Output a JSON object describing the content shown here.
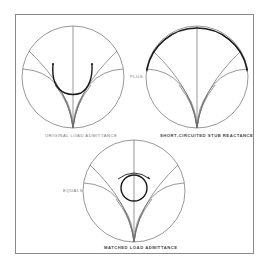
{
  "figure": {
    "panels": [
      {
        "id": "original",
        "caption": "ORIGINAL LOAD ADMITTANCE",
        "point_labels": [
          "Y",
          "Y",
          "Y"
        ]
      },
      {
        "id": "stub",
        "caption": "SHORT-CIRCUITED STUB REACTANCE",
        "point_labels": [
          "Y"
        ]
      },
      {
        "id": "matched",
        "caption": "MATCHED LOAD ADMITTANCE",
        "point_labels": [
          "Y",
          "Y",
          "Y"
        ]
      }
    ],
    "operators": {
      "plus": "PLUS",
      "equals": "EQUALS"
    },
    "colors": {
      "grid_line": "#6b6b6b",
      "trace": "#1a1a1a",
      "frame": "#8a8a8a",
      "caption": "#7a7a7a"
    }
  }
}
